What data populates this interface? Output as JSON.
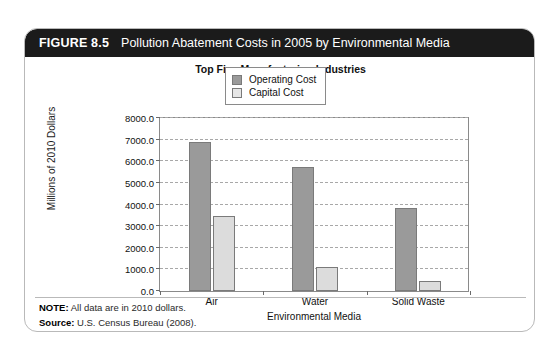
{
  "figure": {
    "number": "FIGURE 8.5",
    "title": "Pollution Abatement Costs in 2005 by Environmental Media"
  },
  "notes": {
    "note_label": "NOTE:",
    "note_text": "All data are in 2010 dollars.",
    "source_label": "Source:",
    "source_text": "U.S. Census Bureau (2008)."
  },
  "colors": {
    "header_background": "#1b1b1b",
    "operating_cost": "#9a9a9a",
    "capital_cost": "#dcdcdc",
    "card_border": "#b9b9b9",
    "gridline": "#a8a8a8"
  },
  "chart_data": {
    "type": "bar",
    "title": "Top Five Manufacturing Industries",
    "xlabel": "Environmental Media",
    "ylabel": "Millions of 2010 Dollars",
    "categories": [
      "Air",
      "Water",
      "Solid Waste"
    ],
    "series": [
      {
        "name": "Operating Cost",
        "values": [
          6800,
          5650,
          3800
        ]
      },
      {
        "name": "Capital Cost",
        "values": [
          3450,
          1100,
          450
        ]
      }
    ],
    "ylim": [
      0,
      8000
    ],
    "ytick_values": [
      0,
      1000,
      2000,
      3000,
      4000,
      5000,
      6000,
      7000,
      8000
    ],
    "ytick_labels": [
      "0.0",
      "1000.0",
      "2000.0",
      "3000.0",
      "4000.0",
      "5000.0",
      "6000.0",
      "7000.0",
      "8000.0"
    ],
    "grid": true,
    "legend_position": "upper right"
  }
}
